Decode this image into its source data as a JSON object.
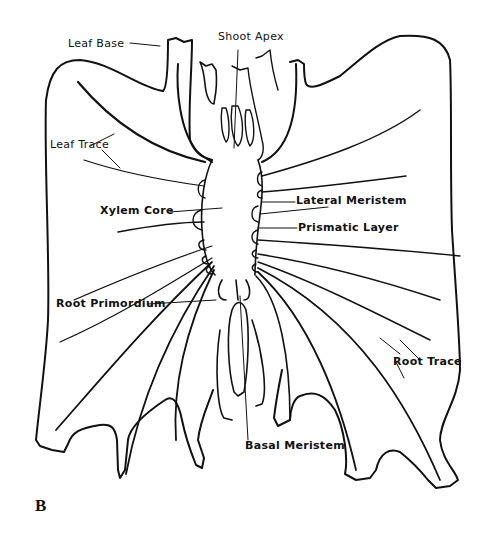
{
  "figure": {
    "panel_label": "B",
    "labels": {
      "leaf_base": "Leaf Base",
      "shoot_apex": "Shoot Apex",
      "leaf_trace": "Leaf Trace",
      "lateral_meristem": "Lateral Meristem",
      "xylem_core": "Xylem Core",
      "prismatic_layer": "Prismatic Layer",
      "root_primordium": "Root Primordium",
      "root_trace": "Root Trace",
      "basal_meristem": "Basal Meristem"
    }
  }
}
